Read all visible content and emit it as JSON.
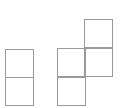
{
  "diagram": {
    "type": "polyomino-figures",
    "stroke_color": "#9a9a9a",
    "background": "#ffffff",
    "cell_size": 28,
    "shapes": [
      {
        "name": "vertical-domino",
        "cell_count": 2,
        "cells": [
          {
            "x": 5,
            "y": 49
          },
          {
            "x": 5,
            "y": 77
          }
        ]
      },
      {
        "name": "s-tetromino-vertical",
        "cell_count": 4,
        "cells": [
          {
            "x": 84,
            "y": 19
          },
          {
            "x": 57,
            "y": 48
          },
          {
            "x": 84,
            "y": 48
          },
          {
            "x": 57,
            "y": 77
          }
        ]
      }
    ]
  }
}
